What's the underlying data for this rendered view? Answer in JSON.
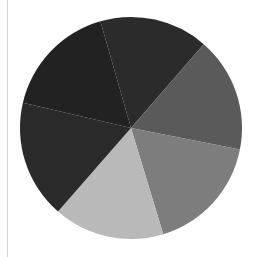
{
  "chart_data": {
    "type": "pie",
    "title": "",
    "legend": [],
    "labels_visible": false,
    "center": [
      131,
      128
    ],
    "radius": 111,
    "start_angle_deg": 254,
    "direction": "clockwise",
    "slices": [
      {
        "name": "slice-1",
        "value": 15.8,
        "color": "#2b2b2b",
        "position": "top"
      },
      {
        "name": "slice-2",
        "value": 16.7,
        "color": "#5a5a5a",
        "position": "right"
      },
      {
        "name": "slice-3",
        "value": 17.2,
        "color": "#7d7d7d",
        "position": "lower-right"
      },
      {
        "name": "slice-4",
        "value": 16.1,
        "color": "#b9b9b9",
        "position": "bottom"
      },
      {
        "name": "slice-5",
        "value": 17.2,
        "color": "#2a2a2a",
        "position": "lower-left"
      },
      {
        "name": "slice-6",
        "value": 16.9,
        "color": "#222222",
        "position": "upper-left"
      }
    ]
  },
  "decorations": {
    "left_rule_color": "#d6d6d6"
  }
}
